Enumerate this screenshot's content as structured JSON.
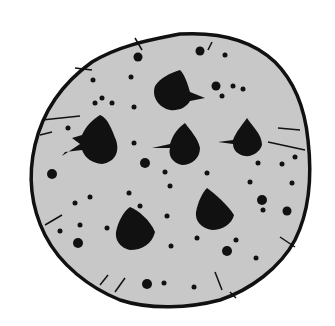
{
  "image": {
    "subject": "chocolate chip cookie illustration",
    "style": "black ink line drawing with gray stippled fill",
    "colors": {
      "background": "#ffffff",
      "cookie_fill": "#c8c8c8",
      "ink": "#111111"
    },
    "chips": [
      {
        "cx": 175,
        "cy": 91
      },
      {
        "cx": 100,
        "cy": 141
      },
      {
        "cx": 185,
        "cy": 146
      },
      {
        "cx": 247,
        "cy": 139
      },
      {
        "cx": 213,
        "cy": 210
      },
      {
        "cx": 135,
        "cy": 229
      }
    ]
  }
}
